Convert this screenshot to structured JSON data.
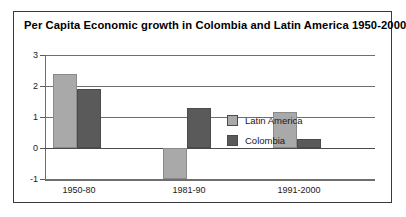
{
  "chart_data": {
    "type": "bar",
    "title": "Per Capita Economic growth in Colombia and Latin America 1950-2000",
    "xlabel": "",
    "ylabel": "",
    "categories": [
      "1950-80",
      "1981-90",
      "1991-2000"
    ],
    "series": [
      {
        "name": "Latin America",
        "color": "#a9a9a9",
        "values": [
          2.4,
          -1.0,
          1.15
        ]
      },
      {
        "name": "Colombia",
        "color": "#5a5a5a",
        "values": [
          1.9,
          1.3,
          0.3
        ]
      }
    ],
    "ylim": [
      -1,
      3
    ],
    "yticks": [
      3,
      2,
      1,
      0,
      -1
    ],
    "ytick_labels": [
      "3",
      "2",
      "1",
      "0",
      "-1"
    ],
    "grid": true,
    "legend_position": "center-right"
  },
  "figure": {
    "border_color": "#3a3a3a",
    "background": "#ffffff"
  }
}
